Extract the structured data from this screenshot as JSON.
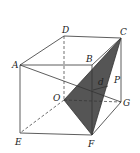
{
  "figure": {
    "type": "cube-geometry",
    "vertices": {
      "A": "A",
      "B": "B",
      "C": "C",
      "D": "D",
      "E": "E",
      "F": "F",
      "G": "G",
      "O": "O"
    },
    "point_label": "P",
    "distance_label": "d",
    "shaded_face": "OCF",
    "colors": {
      "line": "#333333",
      "shade": "#555555",
      "background": "#ffffff"
    }
  }
}
